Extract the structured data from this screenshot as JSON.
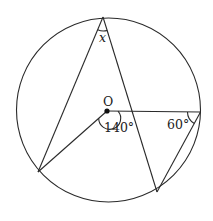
{
  "figure": {
    "labels": {
      "unknown_angle": "x",
      "center": "O",
      "center_angle": "140°",
      "right_angle": "60°"
    },
    "given": {
      "reflex_or_center_angle_deg": 140,
      "angle_at_right_point_deg": 60
    },
    "points": [
      "A (top)",
      "B (lower-left)",
      "C (bottom)",
      "D (right)",
      "O (center)"
    ],
    "segments": [
      "A-B",
      "A-C",
      "O-B",
      "O-D",
      "D-C"
    ]
  }
}
